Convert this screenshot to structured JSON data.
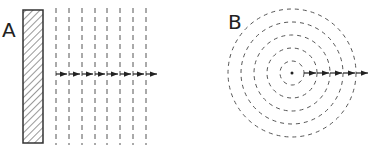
{
  "panels": [
    {
      "label": "A",
      "type": "plane-wave",
      "description": "Plane wavefronts from a flat source",
      "source": "hatched-rectangle",
      "wavefront_count": 8,
      "arrow_count": 8
    },
    {
      "label": "B",
      "type": "spherical-wave",
      "description": "Circular wavefronts from a point source",
      "source": "point",
      "wavefront_count": 5,
      "arrow_count": 5
    }
  ],
  "colors": {
    "stroke": "#333333",
    "dash": "#555555",
    "background": "#ffffff"
  }
}
